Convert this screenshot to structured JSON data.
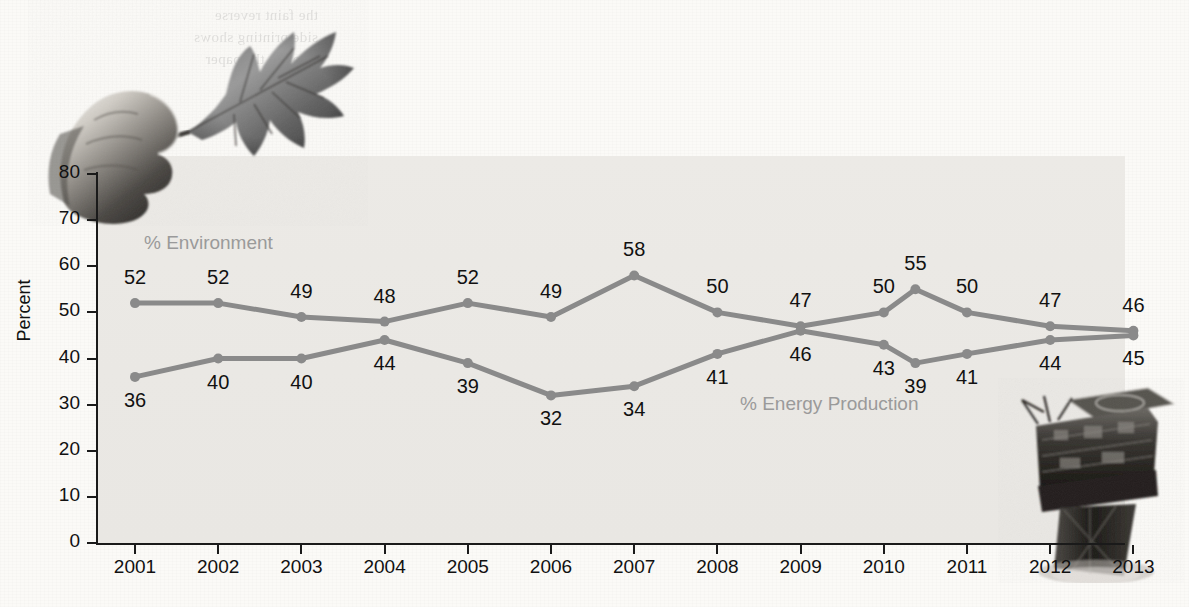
{
  "chart_data": {
    "type": "line",
    "title": "",
    "xlabel": "",
    "ylabel": "Percent",
    "ylim": [
      0,
      80
    ],
    "yticks": [
      0,
      10,
      20,
      30,
      40,
      50,
      60,
      70,
      80
    ],
    "grid": false,
    "legend_position": "inline-annotation",
    "categories": [
      "2001",
      "2002",
      "2003",
      "2004",
      "2005",
      "2006",
      "2007",
      "2008",
      "2009",
      "2010",
      "",
      "2011",
      "2012",
      "2013"
    ],
    "x_tick_labels": [
      "2001",
      "2002",
      "2003",
      "2004",
      "2005",
      "2006",
      "2007",
      "2008",
      "2009",
      "2010",
      "2011",
      "2012",
      "2013"
    ],
    "series": [
      {
        "name": "% Environment",
        "color": "#8a8a8a",
        "values": [
          52,
          52,
          49,
          48,
          52,
          49,
          58,
          50,
          47,
          50,
          55,
          50,
          47,
          46
        ],
        "label_positions": [
          "above",
          "above",
          "above",
          "above",
          "above",
          "above",
          "above",
          "above",
          "above",
          "above",
          "above",
          "above",
          "above",
          "above"
        ]
      },
      {
        "name": "% Energy Production",
        "color": "#8a8a8a",
        "values": [
          36,
          40,
          40,
          44,
          39,
          32,
          34,
          41,
          46,
          43,
          39,
          41,
          44,
          45
        ],
        "label_positions": [
          "below",
          "below",
          "below",
          "below",
          "below",
          "below",
          "below",
          "below",
          "below",
          "below",
          "below",
          "below",
          "below",
          "below"
        ]
      }
    ],
    "annotations": [
      {
        "text": "% Environment",
        "kind": "series-label"
      },
      {
        "text": "% Energy Production",
        "kind": "series-label"
      }
    ]
  },
  "legend": {
    "environment": "% Environment",
    "energy": "% Energy Production"
  },
  "axes": {
    "y_title": "Percent"
  },
  "decorations": {
    "leaf_photo_alt": "hand-holding-maple-leaf",
    "rig_photo_alt": "offshore-oil-platform",
    "bleed_through_text": "the faint reverse\nside printing shows\nthrough the paper"
  },
  "colors": {
    "line": "#8a8a8a",
    "marker": "#8a8a8a",
    "panel": "#eceae6",
    "page": "#fbfaf7",
    "axis": "#1a1a1a",
    "label_text": "#111111",
    "legend_text": "#9a9a9a"
  }
}
